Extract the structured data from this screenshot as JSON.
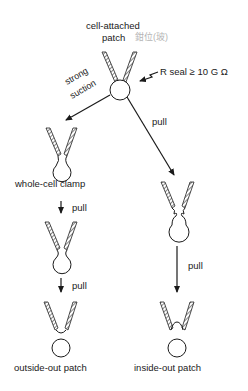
{
  "diagram": {
    "type": "patch-clamp configurations",
    "nodes": {
      "cell_attached": {
        "label_line1": "cell-attached",
        "label_line2": "patch",
        "handwritten_note": "鉗位(玻)"
      },
      "seal": {
        "label": "R seal ≥ 10 G Ω"
      },
      "whole_cell": {
        "label": "whole-cell clamp"
      },
      "outside_out": {
        "label": "outside-out patch"
      },
      "inside_out": {
        "label": "inside-out patch"
      }
    },
    "edges": {
      "strong_suction": {
        "label_line1": "strong",
        "label_line2": "suction"
      },
      "pull_right_diag": {
        "label": "pull"
      },
      "pull_left_down": {
        "label": "pull"
      },
      "pull_left_down2": {
        "label": "pull"
      },
      "pull_right_down": {
        "label": "pull"
      }
    }
  }
}
